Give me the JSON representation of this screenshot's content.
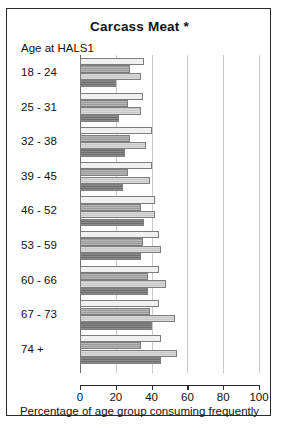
{
  "chart_data": {
    "type": "bar",
    "orientation": "horizontal",
    "title": "Carcass Meat *",
    "xlabel": "Percentage of age group consuming frequently",
    "ylabel": "Age at HALS1",
    "xlim": [
      0,
      100
    ],
    "xticks": [
      0,
      20,
      40,
      60,
      80,
      100
    ],
    "grid": true,
    "legend": "none",
    "categories": [
      "18 - 24",
      "25 - 31",
      "32 - 38",
      "39 - 45",
      "46 - 52",
      "53 - 59",
      "60 - 66",
      "67 - 73",
      "74 +"
    ],
    "series": [
      {
        "name": "series-1",
        "shade": "#f0f0f0",
        "values": [
          36,
          35,
          40,
          40,
          42,
          44,
          44,
          44,
          45
        ]
      },
      {
        "name": "series-2",
        "shade": "#9a9a9a",
        "values": [
          28,
          27,
          28,
          27,
          34,
          35,
          38,
          39,
          34
        ]
      },
      {
        "name": "series-3",
        "shade": "#c7c7c7",
        "values": [
          34,
          34,
          37,
          39,
          42,
          45,
          48,
          53,
          54
        ]
      },
      {
        "name": "series-4",
        "shade": "#6b6b6b",
        "values": [
          20,
          22,
          25,
          24,
          36,
          34,
          38,
          40,
          45
        ]
      }
    ]
  },
  "axis": {
    "title_label": "Age at HALS1",
    "tick_labels": [
      "0",
      "20",
      "40",
      "60",
      "80",
      "100"
    ]
  }
}
